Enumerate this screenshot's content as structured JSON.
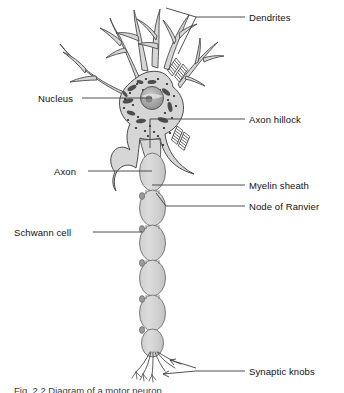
{
  "figure": {
    "title": "Diagram of a motor neuron",
    "caption": "Fig. 2.2  Diagram of a motor neuron",
    "colors": {
      "outline": "#4a4a4a",
      "cell_fill": "#d6d6d6",
      "nucleus_fill": "#a8a8a8",
      "nissl_fill": "#4d4d4d",
      "ribosome_fill": "#2b2b2b",
      "leader_line": "#3c3c3c",
      "background": "#ffffff",
      "text": "#111111"
    },
    "labels": [
      {
        "id": "dendrites",
        "text": "Dendrites",
        "side": "right",
        "x": 249,
        "y": 12
      },
      {
        "id": "nucleus",
        "text": "Nucleus",
        "side": "left",
        "x": 38,
        "y": 93
      },
      {
        "id": "axon-hillock",
        "text": "Axon hillock",
        "side": "right",
        "x": 249,
        "y": 114
      },
      {
        "id": "axon",
        "text": "Axon",
        "side": "left",
        "x": 54,
        "y": 166
      },
      {
        "id": "myelin-sheath",
        "text": "Myelin sheath",
        "side": "right",
        "x": 249,
        "y": 180
      },
      {
        "id": "node-of-ranvier",
        "text": "Node of Ranvier",
        "side": "right",
        "x": 249,
        "y": 201
      },
      {
        "id": "schwann-cell",
        "text": "Schwann cell",
        "side": "left",
        "x": 14,
        "y": 227
      },
      {
        "id": "synaptic-knobs",
        "text": "Synaptic knobs",
        "side": "right",
        "x": 249,
        "y": 366
      }
    ],
    "structures": [
      "soma",
      "nucleus",
      "nucleolus",
      "nissl-bodies",
      "ribosomes",
      "dendrites",
      "axon-hillock",
      "axon",
      "myelin-sheath",
      "node-of-ranvier",
      "schwann-cell",
      "axon-terminals",
      "synaptic-knobs"
    ]
  }
}
